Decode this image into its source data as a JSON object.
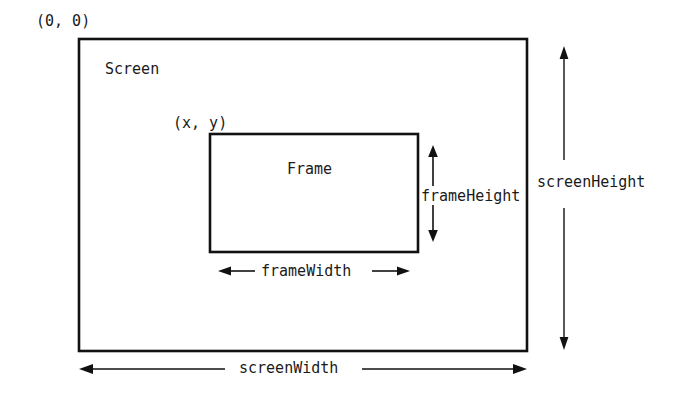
{
  "diagram": {
    "stroke_color": "#111111",
    "text_color": "#1a1a1a",
    "background_color": "#ffffff",
    "labels": {
      "origin": "(0, 0)",
      "screen": "Screen",
      "frame_origin": "(x, y)",
      "frame": "Frame",
      "frame_height": "frameHeight",
      "screen_height": "screenHeight",
      "frame_width": "frameWidth",
      "screen_width": "screenWidth"
    },
    "shapes": {
      "screen_rect": {
        "x": 79,
        "y": 39,
        "width": 448,
        "height": 312
      },
      "frame_rect": {
        "x": 210,
        "y": 134,
        "width": 208,
        "height": 118
      }
    },
    "dimension_arrows": {
      "frame_height": {
        "orientation": "vertical",
        "x": 433,
        "y1": 147,
        "y2": 240,
        "heads": "both"
      },
      "screen_height": {
        "orientation": "vertical",
        "x": 564,
        "y1": 48,
        "y2": 348,
        "heads": "both"
      },
      "frame_width": {
        "orientation": "horizontal",
        "y": 272,
        "x1": 219,
        "x2": 409,
        "heads": "both"
      },
      "screen_width": {
        "orientation": "horizontal",
        "y": 369,
        "x1": 80,
        "x2": 526,
        "heads": "both"
      }
    }
  }
}
